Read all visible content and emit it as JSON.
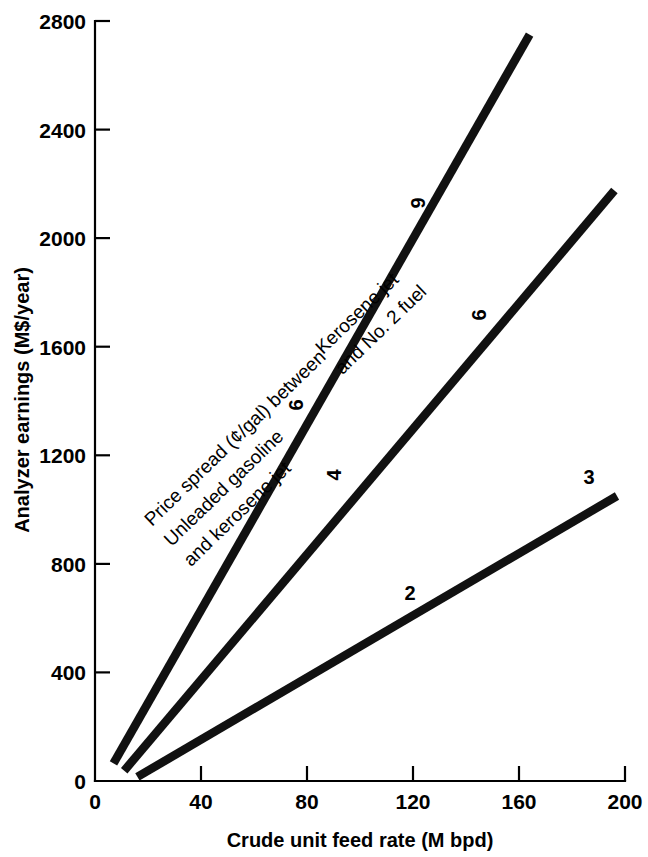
{
  "chart_data": {
    "type": "line",
    "title": "",
    "xlabel": "Crude unit feed rate (M bpd)",
    "ylabel": "Analyzer earnings (M$/year)",
    "xlim": [
      0,
      200
    ],
    "ylim": [
      0,
      2800
    ],
    "xticks": [
      0,
      40,
      80,
      120,
      160,
      200
    ],
    "yticks": [
      0,
      400,
      800,
      1200,
      1600,
      2000,
      2400,
      2800
    ],
    "xtick_labels": [
      "0",
      "40",
      "80",
      "120",
      "160",
      "200"
    ],
    "ytick_labels": [
      "0",
      "400",
      "800",
      "1200",
      "1600",
      "2000",
      "2400",
      "2800"
    ],
    "grid": false,
    "legend_position": "inline-annotations",
    "series": [
      {
        "name": "9",
        "label": "9",
        "description": "Price spread 9 cents per gallon",
        "x": [
          7,
          164
        ],
        "values": [
          65,
          2750
        ],
        "label_x": 152,
        "label_y": 2120
      },
      {
        "name": "6",
        "label": "6",
        "description": "Price spread 6 cents per gallon",
        "x": [
          11,
          196
        ],
        "values": [
          38,
          2175
        ],
        "label_x": 148,
        "label_y": 1735
      },
      {
        "name": "3",
        "label": "3",
        "description": "Price spread 3 cents per gallon",
        "x": [
          16,
          197
        ],
        "values": [
          15,
          1050
        ],
        "label_x": 185,
        "label_y": 1140
      }
    ],
    "inline_series_marks": [
      {
        "name": "mark-6-upper",
        "text": "6",
        "x": 79,
        "y": 1355
      },
      {
        "name": "mark-4-middle",
        "text": "4",
        "x": 93,
        "y": 1100
      },
      {
        "name": "mark-6-middle",
        "text": "6",
        "x": 147,
        "y": 1730
      },
      {
        "name": "mark-2-lower",
        "text": "2",
        "x": 119,
        "y": 690
      },
      {
        "name": "mark-9-upper",
        "text": "9",
        "x": 151,
        "y": 2120
      },
      {
        "name": "mark-3-lower",
        "text": "3",
        "x": 184,
        "y": 1140
      }
    ],
    "annotations": [
      {
        "name": "price-spread-caption",
        "lines": [
          "Price spread (¢/gal) between",
          "Unleaded gasoline",
          "and kerosene jet"
        ],
        "rotation_deg": -44
      },
      {
        "name": "kerosene-caption",
        "lines": [
          "Kerosene jet",
          "and No. 2 fuel"
        ],
        "rotation_deg": -44
      }
    ]
  },
  "colors": {
    "line": "#111111",
    "axis": "#000000",
    "background": "#ffffff",
    "text": "#000000"
  }
}
